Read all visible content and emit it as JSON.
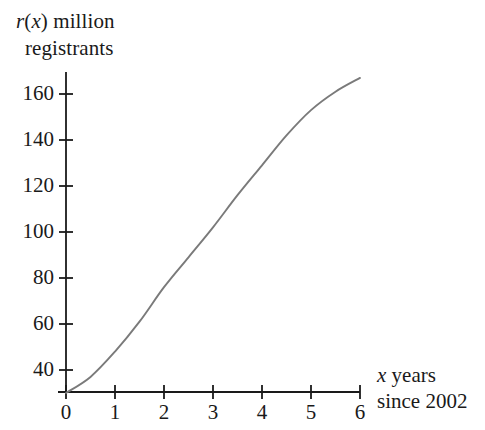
{
  "chart_data": {
    "type": "line",
    "title": "",
    "ylabel_lines": [
      "r(x) million",
      "registrants"
    ],
    "ylabel_italic_parts": [
      "r",
      "x"
    ],
    "xlabel_lines": [
      "x years",
      "since 2002"
    ],
    "xlabel_italic_parts": [
      "x"
    ],
    "x": [
      0,
      0.5,
      1,
      1.5,
      2,
      2.5,
      3,
      3.5,
      4,
      4.5,
      5,
      5.5,
      6
    ],
    "values": [
      30,
      37,
      48,
      61,
      76,
      89,
      102,
      116,
      129,
      142,
      153,
      161,
      167
    ],
    "series": [
      {
        "name": "r(x)",
        "values": [
          30,
          37,
          48,
          61,
          76,
          89,
          102,
          116,
          129,
          142,
          153,
          161,
          167
        ]
      }
    ],
    "xticks": [
      0,
      1,
      2,
      3,
      4,
      5,
      6
    ],
    "xtick_labels": [
      "0",
      "1",
      "2",
      "3",
      "4",
      "5",
      "6"
    ],
    "yticks": [
      40,
      60,
      80,
      100,
      120,
      140,
      160
    ],
    "ytick_labels": [
      "40",
      "60",
      "80",
      "100",
      "120",
      "140",
      "160"
    ],
    "xlim": [
      0,
      6
    ],
    "ylim": [
      30.4,
      168
    ],
    "grid": false,
    "legend": "none",
    "curve_color": "#7a7a7a",
    "axis_color": "#1a1a1a",
    "background_color": "#ffffff"
  },
  "axis_labels": {
    "y_line1_prefix": "r",
    "y_line1_open": "(",
    "y_line1_var": "x",
    "y_line1_rest": ") million",
    "y_line2": "registrants",
    "x_line1_var": "x",
    "x_line1_rest": " years",
    "x_line2": "since 2002"
  }
}
